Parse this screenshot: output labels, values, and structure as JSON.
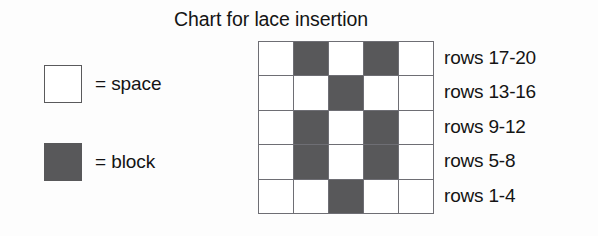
{
  "title": "Chart for lace insertion",
  "legend": {
    "items": [
      {
        "key": "space",
        "symbol_name": "empty-square-swatch",
        "label": "= space",
        "color": "#ffffff"
      },
      {
        "key": "block",
        "symbol_name": "filled-square-swatch",
        "label": "= block",
        "color": "#58585a"
      }
    ]
  },
  "chart_data": {
    "type": "heatmap",
    "title": "Chart for lace insertion",
    "xlabel": "",
    "ylabel": "",
    "columns": 5,
    "rows": 5,
    "grid_on": true,
    "legend_position": "left",
    "value_map": {
      "0": "space",
      "1": "block"
    },
    "colors": {
      "space": "#ffffff",
      "block": "#58585a",
      "gridline": "#6e6e74"
    },
    "row_labels": [
      "rows 17-20",
      "rows 13-16",
      "rows 9-12",
      "rows 5-8",
      "rows 1-4"
    ],
    "values": [
      [
        0,
        1,
        0,
        1,
        0
      ],
      [
        0,
        0,
        1,
        0,
        0
      ],
      [
        0,
        1,
        0,
        1,
        0
      ],
      [
        0,
        1,
        0,
        1,
        0
      ],
      [
        0,
        0,
        1,
        0,
        0
      ]
    ]
  }
}
